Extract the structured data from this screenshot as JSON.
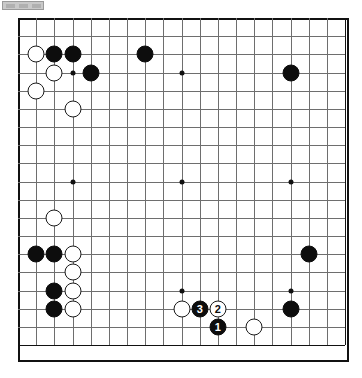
{
  "app": {
    "title": "Go Board Diagram",
    "board_size": 19
  },
  "toolbar": {
    "chip_label": "",
    "segments": 3
  },
  "colors": {
    "black_stone": "#0d0d0d",
    "white_stone": "#ffffff",
    "grid_line": "#6e6e6e",
    "board_border": "#111111",
    "board_background": "#ffffff"
  },
  "board": {
    "size": 19,
    "origin_x": 18,
    "origin_y": 4,
    "spacing": 18.17,
    "hoshi": [
      {
        "col": 3,
        "row": 3
      },
      {
        "col": 9,
        "row": 3
      },
      {
        "col": 15,
        "row": 3
      },
      {
        "col": 3,
        "row": 9
      },
      {
        "col": 9,
        "row": 9
      },
      {
        "col": 15,
        "row": 9
      },
      {
        "col": 3,
        "row": 15
      },
      {
        "col": 9,
        "row": 15
      },
      {
        "col": 15,
        "row": 15
      }
    ],
    "stones": [
      {
        "col": 1,
        "row": 2,
        "color": "white",
        "label": ""
      },
      {
        "col": 2,
        "row": 2,
        "color": "black",
        "label": ""
      },
      {
        "col": 3,
        "row": 2,
        "color": "black",
        "label": ""
      },
      {
        "col": 7,
        "row": 2,
        "color": "black",
        "label": ""
      },
      {
        "col": 2,
        "row": 3,
        "color": "white",
        "label": ""
      },
      {
        "col": 4,
        "row": 3,
        "color": "black",
        "label": ""
      },
      {
        "col": 15,
        "row": 3,
        "color": "black",
        "label": ""
      },
      {
        "col": 1,
        "row": 4,
        "color": "white",
        "label": ""
      },
      {
        "col": 3,
        "row": 5,
        "color": "white",
        "label": ""
      },
      {
        "col": 2,
        "row": 11,
        "color": "white",
        "label": ""
      },
      {
        "col": 1,
        "row": 13,
        "color": "black",
        "label": ""
      },
      {
        "col": 2,
        "row": 13,
        "color": "black",
        "label": ""
      },
      {
        "col": 3,
        "row": 13,
        "color": "white",
        "label": ""
      },
      {
        "col": 16,
        "row": 13,
        "color": "black",
        "label": ""
      },
      {
        "col": 3,
        "row": 14,
        "color": "white",
        "label": ""
      },
      {
        "col": 2,
        "row": 15,
        "color": "black",
        "label": ""
      },
      {
        "col": 3,
        "row": 15,
        "color": "white",
        "label": ""
      },
      {
        "col": 9,
        "row": 16,
        "color": "white",
        "label": ""
      },
      {
        "col": 15,
        "row": 16,
        "color": "black",
        "label": ""
      },
      {
        "col": 10,
        "row": 16,
        "color": "black",
        "label": "3"
      },
      {
        "col": 11,
        "row": 16,
        "color": "white",
        "label": "2"
      },
      {
        "col": 11,
        "row": 17,
        "color": "black",
        "label": "1"
      },
      {
        "col": 13,
        "row": 17,
        "color": "white",
        "label": ""
      },
      {
        "col": 2,
        "row": 16,
        "color": "black",
        "label": ""
      },
      {
        "col": 3,
        "row": 16,
        "color": "white",
        "label": ""
      }
    ],
    "move_sequence": [
      {
        "number": "1",
        "color": "black"
      },
      {
        "number": "2",
        "color": "white"
      },
      {
        "number": "3",
        "color": "black"
      }
    ]
  }
}
